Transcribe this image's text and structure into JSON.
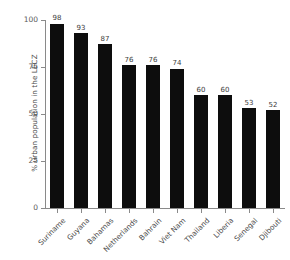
{
  "chart_data": {
    "type": "bar",
    "title": "",
    "subtitle": "",
    "xlabel": "",
    "ylabel": "% urban population in the LECZ",
    "categories": [
      "Suriname",
      "Guyana",
      "Bahamas",
      "Netherlands",
      "Bahrain",
      "Viet Nam",
      "Thailand",
      "Liberia",
      "Senegal",
      "Djibouti"
    ],
    "values": [
      98,
      93,
      87,
      76,
      76,
      74,
      60,
      60,
      53,
      52
    ],
    "value_labels": [
      "98",
      "93",
      "87",
      "76",
      "76",
      "74",
      "60",
      "60",
      "53",
      "52"
    ],
    "ylim": [
      0,
      100
    ],
    "yticks": [
      0,
      25,
      50,
      75,
      100
    ],
    "ytick_labels": [
      "0",
      "25",
      "50",
      "75",
      "100"
    ],
    "grid": false,
    "legend": null,
    "bar_color": "#0d0d0d",
    "axis_color": "#8a8a8a",
    "text_color": "#4a4a4a",
    "background": "#ffffff"
  }
}
